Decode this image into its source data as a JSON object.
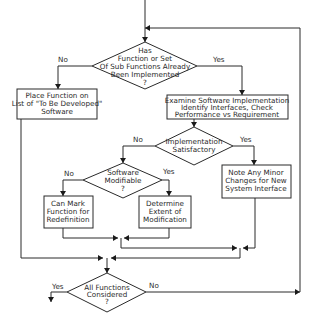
{
  "diagram": {
    "type": "flowchart",
    "nodes": {
      "d1": {
        "shape": "diamond",
        "lines": [
          "Has",
          "Function or Set",
          "Of Sub Functions Already",
          "Been Implemented",
          "?"
        ]
      },
      "b_left": {
        "shape": "box",
        "lines": [
          "Place Function on",
          "List of \"To Be Developed\"",
          "Software"
        ]
      },
      "b_right": {
        "shape": "box",
        "lines": [
          "Examine Software Implementation",
          "Identify Interfaces, Check",
          "Performance vs Requirement"
        ]
      },
      "d2": {
        "shape": "diamond",
        "lines": [
          "Implementation",
          "Satisfactory"
        ]
      },
      "d3": {
        "shape": "diamond",
        "lines": [
          "Software",
          "Modifiable",
          "?"
        ]
      },
      "b_mark": {
        "shape": "box",
        "lines": [
          "Can Mark",
          "Function for",
          "Redefinition"
        ]
      },
      "b_extent": {
        "shape": "box",
        "lines": [
          "Determine",
          "Extent of",
          "Modification"
        ]
      },
      "b_note": {
        "shape": "box",
        "lines": [
          "Note Any Minor",
          "Changes for New",
          "System Interface"
        ]
      },
      "d4": {
        "shape": "diamond",
        "lines": [
          "All Functions",
          "Considered",
          "?"
        ]
      }
    },
    "edge_labels": {
      "d1_no": "No",
      "d1_yes": "Yes",
      "d2_no": "No",
      "d2_yes": "Yes",
      "d3_no": "No",
      "d3_yes": "Yes",
      "d4_yes": "Yes",
      "d4_no": "No"
    },
    "edges": [
      {
        "from": "entry",
        "to": "d1"
      },
      {
        "from": "d1",
        "to": "b_left",
        "label": "No"
      },
      {
        "from": "d1",
        "to": "b_right",
        "label": "Yes"
      },
      {
        "from": "b_right",
        "to": "d2"
      },
      {
        "from": "d2",
        "to": "d3",
        "label": "No"
      },
      {
        "from": "d2",
        "to": "b_note",
        "label": "Yes"
      },
      {
        "from": "d3",
        "to": "b_mark",
        "label": "No"
      },
      {
        "from": "d3",
        "to": "b_extent",
        "label": "Yes"
      },
      {
        "from": "b_mark",
        "to": "merge"
      },
      {
        "from": "b_extent",
        "to": "merge"
      },
      {
        "from": "b_note",
        "to": "merge"
      },
      {
        "from": "b_left",
        "to": "merge"
      },
      {
        "from": "merge",
        "to": "d4"
      },
      {
        "from": "d4",
        "to": "exit",
        "label": "Yes"
      },
      {
        "from": "d4",
        "to": "d1",
        "label": "No"
      }
    ]
  }
}
